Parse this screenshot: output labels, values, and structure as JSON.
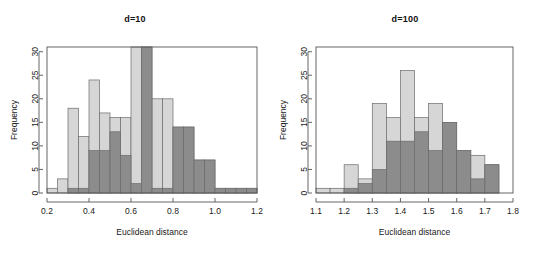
{
  "figure": {
    "background_color": "#ffffff",
    "panel_count": 2
  },
  "colors": {
    "light_series": "#d6d6d6",
    "dark_series": "#8c8c8c",
    "bar_border": "#6b6b6b",
    "axis": "#555555",
    "text": "#1a1a1a"
  },
  "panels": [
    {
      "id": "panel-d10",
      "title": "d=10",
      "chart_data": {
        "type": "bar",
        "subtype": "overlapping-histogram",
        "title": "d=10",
        "xlabel": "Euclidean distance",
        "ylabel": "Frequency",
        "xlim": [
          0.2,
          1.2
        ],
        "ylim": [
          0,
          31
        ],
        "xticks": [
          "0.2",
          "0.4",
          "0.6",
          "0.8",
          "1.0",
          "1.2"
        ],
        "xtick_values": [
          0.2,
          0.4,
          0.6,
          0.8,
          1.0,
          1.2
        ],
        "yticks": [
          "0",
          "5",
          "10",
          "15",
          "20",
          "25",
          "30"
        ],
        "ytick_values": [
          0,
          5,
          10,
          15,
          20,
          25,
          30
        ],
        "grid": false,
        "legend": "none",
        "bin_width": 0.05,
        "series": [
          {
            "name": "light",
            "color": "#d6d6d6",
            "bins": [
              {
                "x0": 0.2,
                "x1": 0.25,
                "value": 1
              },
              {
                "x0": 0.25,
                "x1": 0.3,
                "value": 3
              },
              {
                "x0": 0.3,
                "x1": 0.35,
                "value": 18
              },
              {
                "x0": 0.35,
                "x1": 0.4,
                "value": 12
              },
              {
                "x0": 0.4,
                "x1": 0.45,
                "value": 24
              },
              {
                "x0": 0.45,
                "x1": 0.5,
                "value": 17
              },
              {
                "x0": 0.5,
                "x1": 0.55,
                "value": 16
              },
              {
                "x0": 0.55,
                "x1": 0.6,
                "value": 16
              },
              {
                "x0": 0.6,
                "x1": 0.65,
                "value": 31
              },
              {
                "x0": 0.65,
                "x1": 0.7,
                "value": 31
              },
              {
                "x0": 0.7,
                "x1": 0.75,
                "value": 20
              },
              {
                "x0": 0.75,
                "x1": 0.8,
                "value": 20
              },
              {
                "x0": 0.8,
                "x1": 0.85,
                "value": 14
              },
              {
                "x0": 0.85,
                "x1": 0.9,
                "value": 14
              },
              {
                "x0": 0.9,
                "x1": 0.95,
                "value": 7
              },
              {
                "x0": 0.95,
                "x1": 1.0,
                "value": 7
              },
              {
                "x0": 1.0,
                "x1": 1.05,
                "value": 1
              },
              {
                "x0": 1.05,
                "x1": 1.1,
                "value": 1
              },
              {
                "x0": 1.1,
                "x1": 1.15,
                "value": 1
              },
              {
                "x0": 1.15,
                "x1": 1.2,
                "value": 1
              }
            ]
          },
          {
            "name": "dark",
            "color": "#8c8c8c",
            "bins": [
              {
                "x0": 0.3,
                "x1": 0.35,
                "value": 1
              },
              {
                "x0": 0.35,
                "x1": 0.4,
                "value": 1
              },
              {
                "x0": 0.4,
                "x1": 0.45,
                "value": 9
              },
              {
                "x0": 0.45,
                "x1": 0.5,
                "value": 9
              },
              {
                "x0": 0.5,
                "x1": 0.55,
                "value": 13
              },
              {
                "x0": 0.55,
                "x1": 0.6,
                "value": 8
              },
              {
                "x0": 0.6,
                "x1": 0.65,
                "value": 2
              },
              {
                "x0": 0.65,
                "x1": 0.7,
                "value": 31
              },
              {
                "x0": 0.7,
                "x1": 0.75,
                "value": 1
              },
              {
                "x0": 0.75,
                "x1": 0.8,
                "value": 1
              },
              {
                "x0": 0.8,
                "x1": 0.85,
                "value": 14
              },
              {
                "x0": 0.85,
                "x1": 0.9,
                "value": 14
              },
              {
                "x0": 0.9,
                "x1": 0.95,
                "value": 7
              },
              {
                "x0": 0.95,
                "x1": 1.0,
                "value": 7
              },
              {
                "x0": 1.0,
                "x1": 1.05,
                "value": 1
              },
              {
                "x0": 1.05,
                "x1": 1.1,
                "value": 1
              },
              {
                "x0": 1.1,
                "x1": 1.15,
                "value": 1
              },
              {
                "x0": 1.15,
                "x1": 1.2,
                "value": 1
              }
            ]
          }
        ]
      }
    },
    {
      "id": "panel-d100",
      "title": "d=100",
      "chart_data": {
        "type": "bar",
        "subtype": "overlapping-histogram",
        "title": "d=100",
        "xlabel": "Euclidean distance",
        "ylabel": "Frequency",
        "xlim": [
          1.1,
          1.8
        ],
        "ylim": [
          0,
          31
        ],
        "xticks": [
          "1.1",
          "1.2",
          "1.3",
          "1.4",
          "1.5",
          "1.6",
          "1.7",
          "1.8"
        ],
        "xtick_values": [
          1.1,
          1.2,
          1.3,
          1.4,
          1.5,
          1.6,
          1.7,
          1.8
        ],
        "yticks": [
          "0",
          "5",
          "10",
          "15",
          "20",
          "25",
          "30"
        ],
        "ytick_values": [
          0,
          5,
          10,
          15,
          20,
          25,
          30
        ],
        "grid": false,
        "legend": "none",
        "bin_width": 0.05,
        "series": [
          {
            "name": "light",
            "color": "#d6d6d6",
            "bins": [
              {
                "x0": 1.1,
                "x1": 1.15,
                "value": 1
              },
              {
                "x0": 1.15,
                "x1": 1.2,
                "value": 1
              },
              {
                "x0": 1.2,
                "x1": 1.25,
                "value": 6
              },
              {
                "x0": 1.25,
                "x1": 1.3,
                "value": 3
              },
              {
                "x0": 1.3,
                "x1": 1.35,
                "value": 19
              },
              {
                "x0": 1.35,
                "x1": 1.4,
                "value": 16
              },
              {
                "x0": 1.4,
                "x1": 1.45,
                "value": 26
              },
              {
                "x0": 1.45,
                "x1": 1.5,
                "value": 16
              },
              {
                "x0": 1.5,
                "x1": 1.55,
                "value": 19
              },
              {
                "x0": 1.55,
                "x1": 1.6,
                "value": 15
              },
              {
                "x0": 1.6,
                "x1": 1.65,
                "value": 9
              },
              {
                "x0": 1.65,
                "x1": 1.7,
                "value": 8
              },
              {
                "x0": 1.7,
                "x1": 1.75,
                "value": 6
              }
            ]
          },
          {
            "name": "dark",
            "color": "#8c8c8c",
            "bins": [
              {
                "x0": 1.2,
                "x1": 1.25,
                "value": 1
              },
              {
                "x0": 1.25,
                "x1": 1.3,
                "value": 2
              },
              {
                "x0": 1.3,
                "x1": 1.35,
                "value": 5
              },
              {
                "x0": 1.35,
                "x1": 1.4,
                "value": 11
              },
              {
                "x0": 1.4,
                "x1": 1.45,
                "value": 11
              },
              {
                "x0": 1.45,
                "x1": 1.5,
                "value": 13
              },
              {
                "x0": 1.5,
                "x1": 1.55,
                "value": 9
              },
              {
                "x0": 1.55,
                "x1": 1.6,
                "value": 15
              },
              {
                "x0": 1.6,
                "x1": 1.65,
                "value": 9
              },
              {
                "x0": 1.65,
                "x1": 1.7,
                "value": 3
              },
              {
                "x0": 1.7,
                "x1": 1.75,
                "value": 6
              }
            ]
          }
        ]
      }
    }
  ]
}
